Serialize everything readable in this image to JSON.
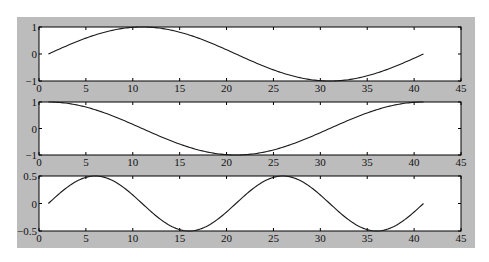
{
  "figure": {
    "background": "#bcbcbc",
    "axes_background": "#ffffff",
    "line_color": "#1a1a1a"
  },
  "chart_data": [
    {
      "type": "line",
      "title": "",
      "xlabel": "",
      "ylabel": "",
      "xlim": [
        0,
        45
      ],
      "ylim": [
        -1,
        1
      ],
      "xticks": [
        0,
        5,
        10,
        15,
        20,
        25,
        30,
        35,
        40,
        45
      ],
      "yticks": [
        -1,
        0,
        1
      ],
      "ytick_labels": [
        "-1",
        "0",
        "1"
      ],
      "grid": false,
      "series": [
        {
          "name": "sin",
          "function": "sin(2*pi*(x-1)/40)",
          "x_range": [
            1,
            41
          ],
          "key_points": [
            [
              1,
              0
            ],
            [
              11,
              1
            ],
            [
              21,
              0
            ],
            [
              31,
              -1
            ],
            [
              41,
              0
            ]
          ]
        }
      ]
    },
    {
      "type": "line",
      "title": "",
      "xlabel": "",
      "ylabel": "",
      "xlim": [
        0,
        45
      ],
      "ylim": [
        -1,
        1
      ],
      "xticks": [
        0,
        5,
        10,
        15,
        20,
        25,
        30,
        35,
        40,
        45
      ],
      "yticks": [
        -1,
        0,
        1
      ],
      "ytick_labels": [
        "-1",
        "0",
        "1"
      ],
      "grid": false,
      "series": [
        {
          "name": "cos",
          "function": "cos(2*pi*(x-1)/40)",
          "x_range": [
            1,
            41
          ],
          "key_points": [
            [
              1,
              1
            ],
            [
              11,
              0
            ],
            [
              21,
              -1
            ],
            [
              31,
              0
            ],
            [
              41,
              1
            ]
          ]
        }
      ]
    },
    {
      "type": "line",
      "title": "",
      "xlabel": "",
      "ylabel": "",
      "xlim": [
        0,
        45
      ],
      "ylim": [
        -0.5,
        0.5
      ],
      "xticks": [
        0,
        5,
        10,
        15,
        20,
        25,
        30,
        35,
        40,
        45
      ],
      "yticks": [
        -0.5,
        0,
        0.5
      ],
      "ytick_labels": [
        "-0.5",
        "0",
        "0.5"
      ],
      "grid": false,
      "series": [
        {
          "name": "0.5*sin(2x)",
          "function": "0.5*sin(2*pi*(x-1)/20)",
          "x_range": [
            1,
            41
          ],
          "key_points": [
            [
              1,
              0
            ],
            [
              6,
              0.5
            ],
            [
              11,
              0
            ],
            [
              16,
              -0.5
            ],
            [
              21,
              0
            ],
            [
              26,
              0.5
            ],
            [
              31,
              0
            ],
            [
              36,
              -0.5
            ],
            [
              41,
              0
            ]
          ]
        }
      ]
    }
  ]
}
